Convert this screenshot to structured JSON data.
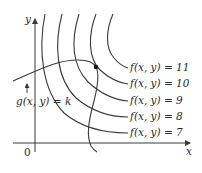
{
  "figure": {
    "axes": {
      "x_label": "x",
      "y_label": "y",
      "origin_label": "0"
    },
    "constraint_curve": {
      "label": "g(x, y) = k"
    },
    "level_curves": [
      {
        "label": "f(x, y) = 11",
        "value": 11
      },
      {
        "label": "f(x, y) = 10",
        "value": 10
      },
      {
        "label": "f(x, y) = 9",
        "value": 9
      },
      {
        "label": "f(x, y) = 8",
        "value": 8
      },
      {
        "label": "f(x, y) = 7",
        "value": 7
      }
    ],
    "tangent_point": {
      "description": "point where g(x,y)=k is tangent to f(x,y)=10"
    },
    "colors": {
      "stroke": "#3a3a3a",
      "background": "#ffffff"
    }
  }
}
